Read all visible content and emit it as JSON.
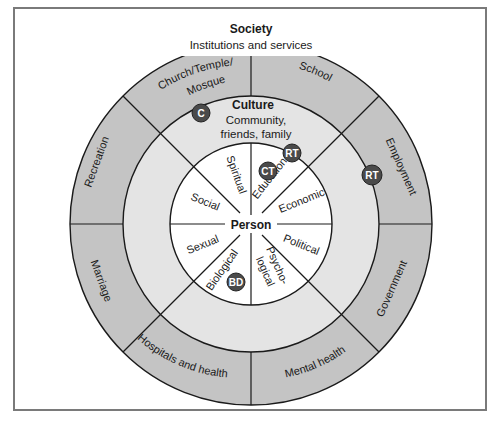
{
  "diagram": {
    "type": "concentric-wheel",
    "society": {
      "title": "Society",
      "subtitle": "Institutions and services",
      "segments": [
        "School",
        "Employment",
        "Government",
        "Mental health",
        "Hospitals and health",
        "Marriage",
        "Recreation",
        "Church/Temple/ Mosque"
      ]
    },
    "culture": {
      "title": "Culture",
      "subtitle_line1": "Community,",
      "subtitle_line2": "friends, family"
    },
    "person": {
      "title": "Person",
      "segments": [
        "Educational",
        "Economic",
        "Political",
        "Psycho- logical",
        "Biological",
        "Sexual",
        "Social",
        "Spiritual"
      ]
    },
    "markers": [
      {
        "label": "C",
        "location": "culture ring near Church/Temple/Mosque"
      },
      {
        "label": "RT",
        "location": "inner edge of culture ring near Educational"
      },
      {
        "label": "CT",
        "location": "Educational segment"
      },
      {
        "label": "RT",
        "location": "culture ring near Employment"
      },
      {
        "label": "BD",
        "location": "Biological segment"
      }
    ]
  },
  "colors": {
    "outer_ring": "#c4c4c4",
    "middle_ring": "#e4e4e4",
    "inner_circle": "#ffffff",
    "marker_fill": "#4a4a4a",
    "marker_text": "#ffffff",
    "lines": "#1a1a1a",
    "frame": "#7a7a7a"
  },
  "labels": {
    "society_title": "Society",
    "society_subtitle": "Institutions and services",
    "culture_title": "Culture",
    "culture_line1": "Community,",
    "culture_line2": "friends, family",
    "person": "Person",
    "school": "School",
    "employment": "Employment",
    "government": "Government",
    "mental_health": "Mental health",
    "hospitals": "Hospitals and health",
    "marriage": "Marriage",
    "recreation": "Recreation",
    "church_line1": "Church/Temple/",
    "church_line2": "Mosque",
    "educational": "Educational",
    "economic": "Economic",
    "political": "Political",
    "psycho_line1": "Psycho-",
    "psycho_line2": "logical",
    "biological": "Biological",
    "sexual": "Sexual",
    "social": "Social",
    "spiritual": "Spiritual",
    "marker_c": "C",
    "marker_rt1": "RT",
    "marker_ct": "CT",
    "marker_rt2": "RT",
    "marker_bd": "BD"
  }
}
